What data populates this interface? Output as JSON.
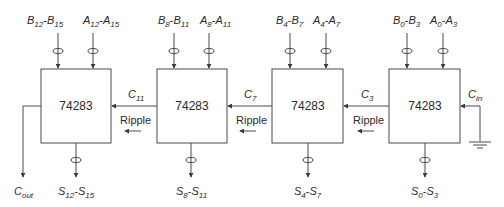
{
  "diagram": {
    "stages": [
      {
        "chip": "74283",
        "b_input": {
          "base": "B",
          "from": "12",
          "to": "15"
        },
        "a_input": {
          "base": "A",
          "from": "12",
          "to": "15"
        },
        "sum_output": {
          "base": "S",
          "from": "12",
          "to": "15"
        },
        "carry_in_label": {
          "base": "C",
          "sub": "11"
        },
        "ripple_label": "Ripple"
      },
      {
        "chip": "74283",
        "b_input": {
          "base": "B",
          "from": "8",
          "to": "11"
        },
        "a_input": {
          "base": "A",
          "from": "8",
          "to": "11"
        },
        "sum_output": {
          "base": "S",
          "from": "8",
          "to": "11"
        },
        "carry_in_label": {
          "base": "C",
          "sub": "7"
        },
        "ripple_label": "Ripple"
      },
      {
        "chip": "74283",
        "b_input": {
          "base": "B",
          "from": "4",
          "to": "7"
        },
        "a_input": {
          "base": "A",
          "from": "4",
          "to": "7"
        },
        "sum_output": {
          "base": "S",
          "from": "4",
          "to": "7"
        },
        "carry_in_label": {
          "base": "C",
          "sub": "3"
        },
        "ripple_label": "Ripple"
      },
      {
        "chip": "74283",
        "b_input": {
          "base": "B",
          "from": "0",
          "to": "3"
        },
        "a_input": {
          "base": "A",
          "from": "0",
          "to": "3"
        },
        "sum_output": {
          "base": "S",
          "from": "0",
          "to": "3"
        },
        "carry_in_label": {
          "base": "C",
          "sub": "in"
        },
        "ripple_label": null
      }
    ],
    "carry_out": {
      "base": "C",
      "sub": "out"
    },
    "ground_symbol": "ground-icon",
    "dash": "-"
  }
}
